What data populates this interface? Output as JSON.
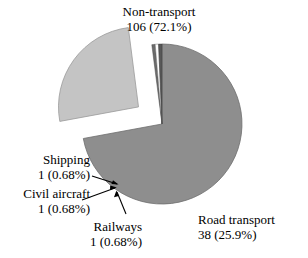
{
  "chart_data": {
    "type": "pie",
    "title": "",
    "total": 147,
    "unit": "count",
    "categories": [
      "Non-transport",
      "Road transport",
      "Shipping",
      "Civil aircraft",
      "Railways"
    ],
    "values": [
      106,
      38,
      1,
      1,
      1
    ],
    "percent_labels": [
      "72.1%",
      "25.9%",
      "0.68%",
      "0.68%",
      "0.68%"
    ],
    "slices": [
      {
        "name": "Non-transport",
        "value": 106,
        "percent": 72.1,
        "value_label": "106 (72.1%)",
        "color": "#8e8e8e",
        "exploded": false,
        "label_position": "top"
      },
      {
        "name": "Road transport",
        "value": 38,
        "percent": 25.9,
        "value_label": "38 (25.9%)",
        "color": "#c4c4c4",
        "exploded": true,
        "label_position": "bottom-right"
      },
      {
        "name": "Shipping",
        "value": 1,
        "percent": 0.68,
        "value_label": "1 (0.68%)",
        "color": "#6b6b6b",
        "exploded": false,
        "label_position": "left",
        "leader_line": true
      },
      {
        "name": "Civil aircraft",
        "value": 1,
        "percent": 0.68,
        "value_label": "1 (0.68%)",
        "color": "#ffffff",
        "exploded": false,
        "label_position": "left",
        "leader_line": true
      },
      {
        "name": "Railways",
        "value": 1,
        "percent": 0.68,
        "value_label": "1 (0.68%)",
        "color": "#585858",
        "exploded": false,
        "label_position": "bottom-left",
        "leader_line": true
      }
    ],
    "legend": "none",
    "grid": false,
    "xlabel": "",
    "ylabel": ""
  },
  "labels": {
    "non_transport": {
      "name": "Non-transport",
      "value": "106 (72.1%)"
    },
    "road_transport": {
      "name": "Road transport",
      "value": "38 (25.9%)"
    },
    "shipping": {
      "name": "Shipping",
      "value": "1 (0.68%)"
    },
    "civil_aircraft": {
      "name": "Civil aircraft",
      "value": "1 (0.68%)"
    },
    "railways": {
      "name": "Railways",
      "value": "1 (0.68%)"
    }
  },
  "colors": {
    "background": "#ffffff",
    "text": "#000000",
    "non_transport_fill": "#8e8e8e",
    "road_transport_fill": "#c4c4c4",
    "shipping_fill": "#6b6b6b",
    "civil_aircraft_fill": "#ffffff",
    "railways_fill": "#585858",
    "outline": "#555555",
    "leader": "#000000"
  }
}
